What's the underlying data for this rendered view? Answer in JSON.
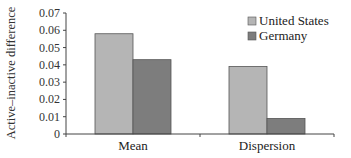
{
  "chart_data": {
    "type": "bar",
    "title": "",
    "xlabel": "",
    "ylabel": "Active–inactive difference",
    "categories": [
      "Mean",
      "Dispersion"
    ],
    "series": [
      {
        "name": "United States",
        "values": [
          0.058,
          0.039
        ],
        "color": "#b5b5b5"
      },
      {
        "name": "Germany",
        "values": [
          0.043,
          0.009
        ],
        "color": "#7d7d7d"
      }
    ],
    "ylim": [
      0,
      0.07
    ],
    "yticks": [
      "0",
      "0.01",
      "0.02",
      "0.03",
      "0.04",
      "0.05",
      "0.06",
      "0.07"
    ],
    "grid": false,
    "legend_position": "upper right"
  }
}
